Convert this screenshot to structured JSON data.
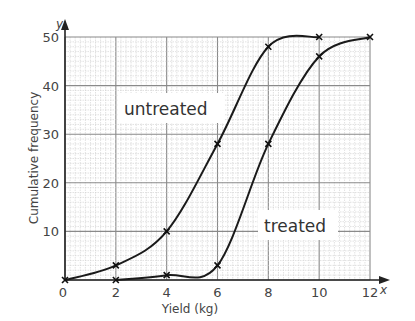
{
  "chart_data": {
    "type": "line",
    "title": "",
    "xlabel": "Yield (kg)",
    "ylabel": "Cumulative frequency",
    "x_axis_symbol": "x",
    "y_axis_symbol": "y",
    "xlim": [
      0,
      12
    ],
    "ylim": [
      0,
      50
    ],
    "x_ticks": [
      0,
      2,
      4,
      6,
      8,
      10,
      12
    ],
    "y_ticks": [
      10,
      20,
      30,
      40,
      50
    ],
    "grid": true,
    "series": [
      {
        "name": "untreated",
        "x": [
          0,
          2,
          4,
          6,
          8,
          10
        ],
        "y": [
          0,
          3,
          10,
          28,
          48,
          50
        ]
      },
      {
        "name": "treated",
        "x": [
          2,
          4,
          6,
          8,
          10,
          12
        ],
        "y": [
          0,
          1,
          3,
          28,
          46,
          50
        ]
      }
    ],
    "annotations": [
      {
        "text": "untreated",
        "near_series": "untreated"
      },
      {
        "text": "treated",
        "near_series": "treated"
      }
    ]
  },
  "labels": {
    "xlabel": "Yield (kg)",
    "ylabel": "Cumulative frequency",
    "x_sym": "x",
    "y_sym": "y",
    "untreated": "untreated",
    "treated": "treated",
    "origin": "0"
  }
}
